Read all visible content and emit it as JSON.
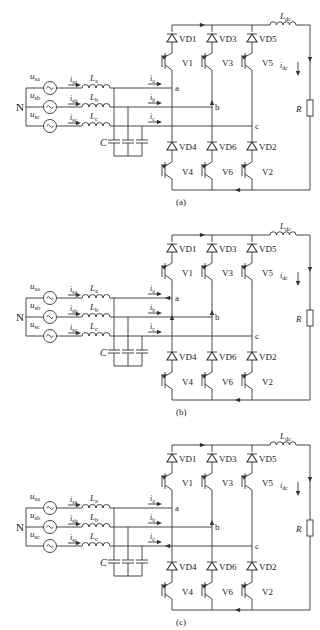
{
  "figure": {
    "panels": [
      {
        "id": "a",
        "caption": "(a)",
        "y": 0,
        "arrows": {
          "dc_bus_top": "right",
          "dc_return": "left",
          "node_b_vertical": "up",
          "node_c_left": false,
          "node_a_left": false,
          "node_b_left": false,
          "node_a_vertical": false
        }
      },
      {
        "id": "b",
        "caption": "(b)",
        "y": 210,
        "arrows": {
          "dc_bus_top": "right",
          "dc_return": "left",
          "node_b_vertical": "up",
          "node_a_vertical": "up",
          "node_a_left": true,
          "node_b_left": false,
          "node_c_left": false
        }
      },
      {
        "id": "c",
        "caption": "(c)",
        "y": 420,
        "arrows": {
          "dc_bus_top": "right",
          "dc_return": "left",
          "node_b_vertical": "up",
          "node_a_vertical": false,
          "node_a_left": false,
          "node_b_left": false,
          "node_c_left": true
        }
      }
    ],
    "labels": {
      "neutral": "N",
      "sources": [
        "u",
        "u",
        "u"
      ],
      "source_subs": [
        "sa",
        "sb",
        "sc"
      ],
      "line_currents": [
        "i",
        "i",
        "i"
      ],
      "line_current_subs": [
        "sa",
        "sb",
        "sc"
      ],
      "inductors": [
        "L",
        "L",
        "L"
      ],
      "inductor_subs": [
        "a",
        "b",
        "c"
      ],
      "capacitor": "C",
      "bridge_currents": [
        "i",
        "i",
        "i"
      ],
      "bridge_current_subs": [
        "a",
        "b",
        "c"
      ],
      "nodes": [
        "a",
        "b",
        "c"
      ],
      "upper_diodes": [
        "VD1",
        "VD3",
        "VD5"
      ],
      "upper_switches": [
        "V1",
        "V3",
        "V5"
      ],
      "lower_diodes": [
        "VD4",
        "VD6",
        "VD2"
      ],
      "lower_switches": [
        "V4",
        "V6",
        "V2"
      ],
      "dc_inductor": "L",
      "dc_inductor_sub": "dc",
      "dc_current": "i",
      "dc_current_sub": "dc",
      "load": "R"
    }
  }
}
